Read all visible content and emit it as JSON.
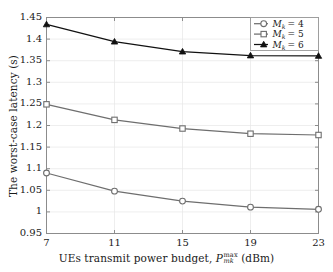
{
  "chart_data": {
    "type": "line",
    "title": "",
    "xlabel": "UEs transmit power budget, P_mk^max (dBm)",
    "ylabel": "The worst-case latency (s)",
    "x": [
      7,
      11,
      15,
      19,
      23
    ],
    "xticklabels": [
      "7",
      "11",
      "15",
      "19",
      "23"
    ],
    "yticklabels": [
      "0.95",
      "1",
      "1.05",
      "1.1",
      "1.15",
      "1.2",
      "1.25",
      "1.3",
      "1.35",
      "1.4",
      "1.45"
    ],
    "yticks": [
      0.95,
      1.0,
      1.05,
      1.1,
      1.15,
      1.2,
      1.25,
      1.3,
      1.35,
      1.4,
      1.45
    ],
    "xlim": [
      7,
      23
    ],
    "ylim": [
      0.95,
      1.45
    ],
    "grid": true,
    "legend_position": "upper right",
    "series": [
      {
        "name": "M_k = 4",
        "legend_label_base": "M",
        "legend_label_sub": "k",
        "legend_label_eq": "= 4",
        "marker": "circle-open",
        "color": "#6e6e6e",
        "values": [
          1.09,
          1.048,
          1.025,
          1.011,
          1.006
        ]
      },
      {
        "name": "M_k = 5",
        "legend_label_base": "M",
        "legend_label_sub": "k",
        "legend_label_eq": "= 5",
        "marker": "square-open",
        "color": "#6e6e6e",
        "values": [
          1.249,
          1.213,
          1.193,
          1.181,
          1.178
        ]
      },
      {
        "name": "M_k = 6",
        "legend_label_base": "M",
        "legend_label_sub": "k",
        "legend_label_eq": "= 6",
        "marker": "triangle-filled",
        "color": "#111111",
        "values": [
          1.434,
          1.394,
          1.371,
          1.362,
          1.361
        ]
      }
    ]
  },
  "axes": {
    "ylabel_text": "The worst-case latency (s)",
    "xlabel_prefix": "UEs transmit power budget,",
    "xlabel_symbol": "P",
    "xlabel_sup": "max",
    "xlabel_sub": "mk",
    "xlabel_unit": "(dBm)"
  },
  "colors": {
    "axis": "#8c8c8c",
    "grid": "#e6e6e6",
    "gray_series": "#6e6e6e",
    "black_series": "#111111",
    "text": "#1a1a1a",
    "background": "#ffffff",
    "legend_border": "#9a9a9a"
  }
}
